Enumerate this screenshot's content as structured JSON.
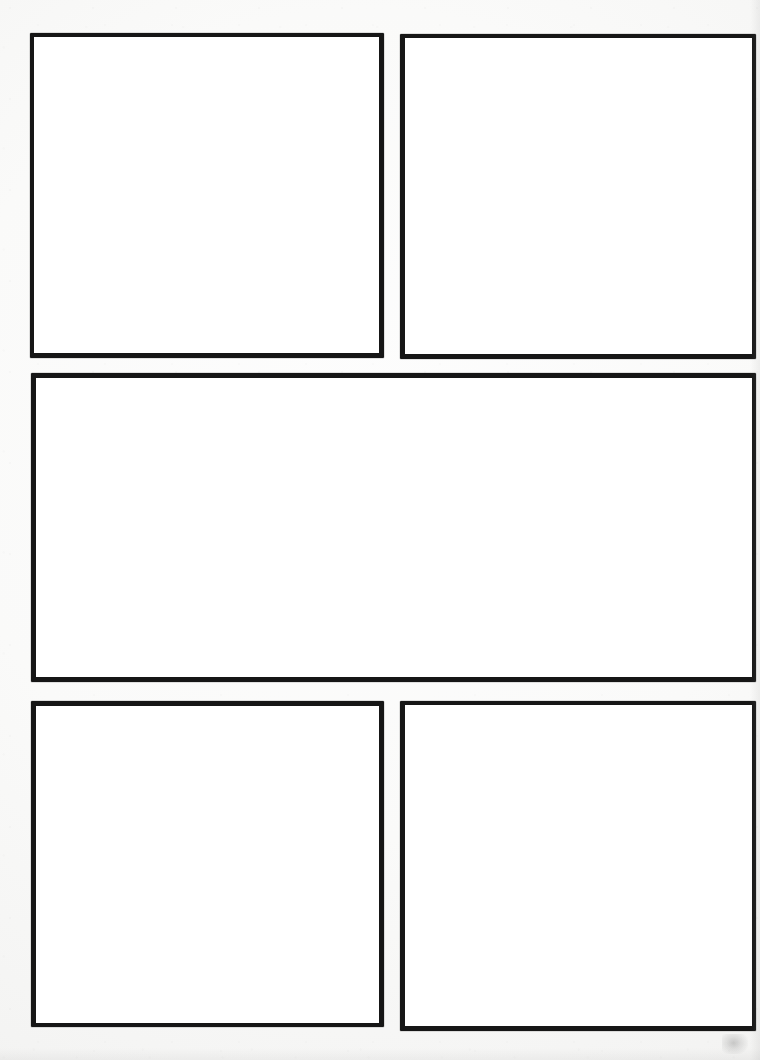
{
  "document": {
    "kind": "blank-comic-page-template",
    "title": "",
    "page_width": 760,
    "page_height": 1060,
    "background_color": "#f8f8f7",
    "paper_color": "#ffffff",
    "ink_color": "#161616",
    "visible_text": "",
    "row_count": 3,
    "panel_count": 5
  },
  "panels": [
    {
      "id": "panel-1",
      "row": 1,
      "column": 1,
      "label": "",
      "content": "",
      "shape": "rectangle",
      "x": 30,
      "y": 33,
      "width": 354,
      "height": 325,
      "border_width": 4,
      "border_color": "#161616",
      "fill_color": "#ffffff"
    },
    {
      "id": "panel-2",
      "row": 1,
      "column": 2,
      "label": "",
      "content": "",
      "shape": "rectangle",
      "x": 400,
      "y": 34,
      "width": 356,
      "height": 325,
      "border_width": 4,
      "border_color": "#161616",
      "fill_color": "#ffffff"
    },
    {
      "id": "panel-3",
      "row": 2,
      "column": 1,
      "label": "",
      "content": "",
      "shape": "rectangle-wide",
      "x": 31,
      "y": 373,
      "width": 725,
      "height": 309,
      "border_width": 5,
      "border_color": "#161616",
      "fill_color": "#ffffff"
    },
    {
      "id": "panel-4",
      "row": 3,
      "column": 1,
      "label": "",
      "content": "",
      "shape": "rectangle",
      "x": 31,
      "y": 701,
      "width": 353,
      "height": 326,
      "border_width": 5,
      "border_color": "#161616",
      "fill_color": "#ffffff"
    },
    {
      "id": "panel-5",
      "row": 3,
      "column": 2,
      "label": "",
      "content": "",
      "shape": "rectangle",
      "x": 400,
      "y": 701,
      "width": 356,
      "height": 330,
      "border_width": 4,
      "border_color": "#161616",
      "fill_color": "#ffffff"
    }
  ],
  "layout": {
    "gutter_horizontal": 16,
    "gutter_vertical": 16,
    "margin_left": 30,
    "margin_right": 4,
    "margin_top": 33,
    "margin_bottom": 29
  },
  "artifacts": [
    {
      "id": "scan-smudge",
      "kind": "scan-smudge",
      "x": 722,
      "y": 1034,
      "width": 26,
      "height": 20,
      "color": "#6a6a6a"
    }
  ]
}
